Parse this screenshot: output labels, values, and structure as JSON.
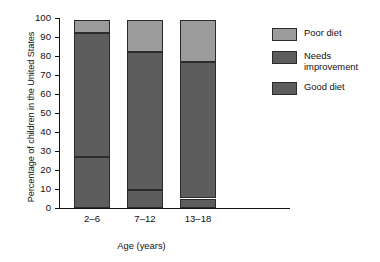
{
  "chart_data": {
    "type": "bar",
    "stacked": true,
    "title": "",
    "xlabel": "Age (years)",
    "ylabel": "Percentage of children in the United States",
    "categories": [
      "2–6",
      "7–12",
      "13–18"
    ],
    "ylim": [
      0,
      100
    ],
    "yticks": [
      0,
      10,
      20,
      30,
      40,
      50,
      60,
      70,
      80,
      90,
      100
    ],
    "ytick_labels": [
      "0",
      "10",
      "20",
      "30",
      "40",
      "50",
      "60",
      "70",
      "80",
      "90",
      "100"
    ],
    "grid": false,
    "legend_position": "right",
    "series": [
      {
        "name": "Good diet",
        "values": [
          27,
          9.5,
          5
        ],
        "color": "#5d5d5d"
      },
      {
        "name": "Needs improvement",
        "values": [
          65,
          72.5,
          72
        ],
        "color": "#5d5d5d"
      },
      {
        "name": "Poor diet",
        "values": [
          7,
          17,
          22
        ],
        "color": "#9b9b9b"
      }
    ],
    "cumulative_tops": [
      {
        "category": "2–6",
        "good_diet": 27,
        "needs_improvement": 92,
        "poor_diet": 99
      },
      {
        "category": "7–12",
        "good_diet": 9.5,
        "needs_improvement": 82,
        "poor_diet": 99
      },
      {
        "category": "13–18",
        "good_diet": 5,
        "needs_improvement": 77,
        "poor_diet": 99
      }
    ]
  },
  "legend": {
    "items": [
      {
        "label": "Poor diet",
        "color": "#9b9b9b"
      },
      {
        "label": "Needs\nimprovement",
        "color": "#5d5d5d"
      },
      {
        "label": "Good diet",
        "color": "#5d5d5d"
      }
    ]
  }
}
